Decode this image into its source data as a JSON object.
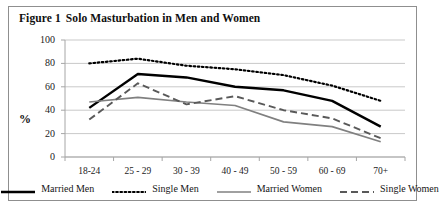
{
  "figure": {
    "label": "Figure 1",
    "title": "Solo Masturbation in Men and Women"
  },
  "chart_data": {
    "type": "line",
    "title": "Solo Masturbation in Men and Women",
    "xlabel": "",
    "ylabel": "%",
    "ylim": [
      0,
      100
    ],
    "yticks": [
      0,
      20,
      40,
      60,
      80,
      100
    ],
    "grid": true,
    "legend_position": "bottom",
    "categories": [
      "18-24",
      "25 - 29",
      "30 - 39",
      "40 - 49",
      "50 - 59",
      "60 - 69",
      "70+"
    ],
    "series": [
      {
        "name": "Married Men",
        "style": "solid-thick",
        "color": "#000000",
        "values": [
          42,
          71,
          68,
          60,
          57,
          48,
          26
        ]
      },
      {
        "name": "Single Men",
        "style": "dotted",
        "color": "#000000",
        "values": [
          80,
          84,
          78,
          75,
          70,
          61,
          48
        ]
      },
      {
        "name": "Married Women",
        "style": "solid-thin",
        "color": "#808080",
        "values": [
          47,
          51,
          47,
          44,
          30,
          26,
          13
        ]
      },
      {
        "name": "Single Women",
        "style": "dashed",
        "color": "#595959",
        "values": [
          32,
          63,
          45,
          52,
          40,
          33,
          16
        ]
      }
    ]
  },
  "colors": {
    "frame": "#8f8f8f",
    "grid": "#c9c9c9",
    "axis": "#a6a6a6",
    "text": "#1a1a1a"
  }
}
